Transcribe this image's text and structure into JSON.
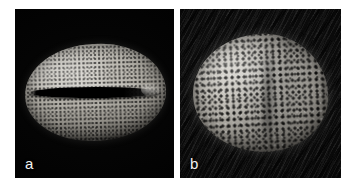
{
  "figure": {
    "type": "sem-micrograph-plate",
    "background_color": "#ffffff",
    "panel_count": 2
  },
  "panels": [
    {
      "id": "a",
      "label": "a",
      "label_color": "#f2f2f2",
      "background_color": "#000000",
      "background_texture": "plain-black",
      "specimen": "pollen-grain-equatorial-view",
      "specimen_shape": "elongate-ellipsoidal",
      "surface_ornamentation": "finely-punctate",
      "aperture": "single longitudinal colpus (furrow)",
      "aperture_color": "#000000",
      "specimen_color_light": "#d8d6d0",
      "specimen_color_mid": "#9d9a93",
      "specimen_color_dark": "#2a2927"
    },
    {
      "id": "b",
      "label": "b",
      "label_color": "#f2f2f2",
      "background_color": "#0a0a0a",
      "background_texture": "diagonal-streaked-dark",
      "specimen": "pollen-grain-polar-view",
      "specimen_shape": "rounded-ovoid",
      "surface_ornamentation": "reticulate-foveolate",
      "aperture": "not visible",
      "specimen_color_light": "#dedcd6",
      "specimen_color_mid": "#a8a59e",
      "specimen_color_dark": "#3b3a37"
    }
  ]
}
